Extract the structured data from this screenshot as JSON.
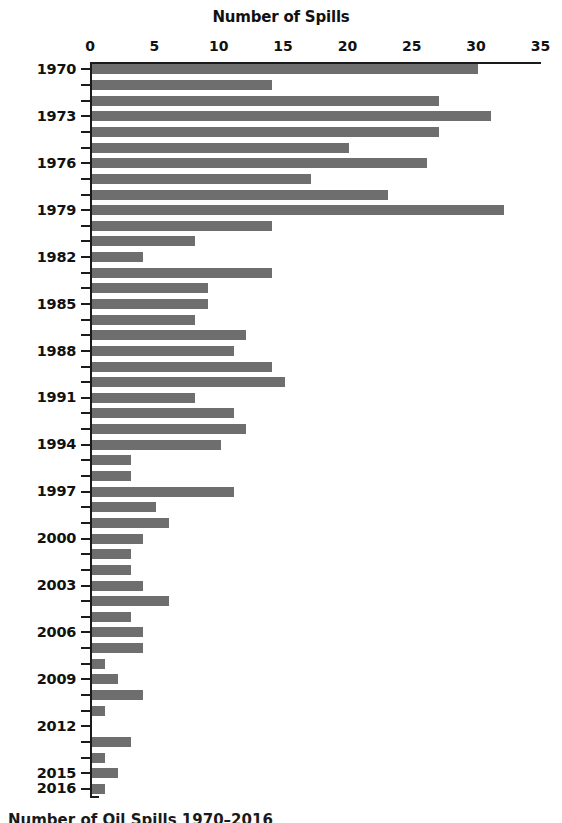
{
  "chart_data": {
    "type": "bar",
    "orientation": "horizontal",
    "title": "Number of Spills",
    "xlabel": "Number of Spills",
    "ylabel": "",
    "xlim": [
      0,
      35
    ],
    "xticks": [
      0,
      5,
      10,
      15,
      20,
      25,
      30,
      35
    ],
    "xtick_labels": [
      "0",
      "5",
      "10",
      "15",
      "20",
      "25",
      "30",
      "35"
    ],
    "grid": false,
    "legend": false,
    "bar_color": "#6e6e6e",
    "axis_color": "#1a1a1a",
    "categories": [
      "1970",
      "1971",
      "1972",
      "1973",
      "1974",
      "1975",
      "1976",
      "1977",
      "1978",
      "1979",
      "1980",
      "1981",
      "1982",
      "1983",
      "1984",
      "1985",
      "1986",
      "1987",
      "1988",
      "1989",
      "1990",
      "1991",
      "1992",
      "1993",
      "1994",
      "1995",
      "1996",
      "1997",
      "1998",
      "1999",
      "2000",
      "2001",
      "2002",
      "2003",
      "2004",
      "2005",
      "2006",
      "2007",
      "2008",
      "2009",
      "2010",
      "2011",
      "2012",
      "2013",
      "2014",
      "2015",
      "2016"
    ],
    "values": [
      30,
      14,
      27,
      31,
      27,
      20,
      26,
      17,
      23,
      32,
      14,
      8,
      4,
      14,
      9,
      9,
      8,
      12,
      11,
      14,
      15,
      8,
      11,
      12,
      10,
      3,
      3,
      11,
      5,
      6,
      4,
      3,
      3,
      4,
      6,
      3,
      4,
      4,
      1,
      2,
      4,
      1,
      0,
      3,
      1,
      2,
      1
    ],
    "labeled_categories": [
      "1970",
      "1973",
      "1976",
      "1979",
      "1982",
      "1985",
      "1988",
      "1991",
      "1994",
      "1997",
      "2000",
      "2003",
      "2006",
      "2009",
      "2012",
      "2015",
      "2016"
    ]
  },
  "caption": {
    "text": "Number of Oil Spills 1970–2016"
  }
}
